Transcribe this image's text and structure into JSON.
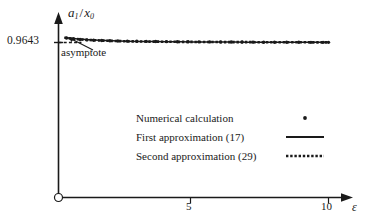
{
  "chart_data": {
    "type": "line",
    "title": "",
    "xlabel": "ε",
    "ylabel": "a_1/x_0",
    "xlim": [
      0,
      11.8
    ],
    "ylim": [
      0.9632,
      0.966
    ],
    "grid": false,
    "legend_position": "center-right",
    "xticks": [
      5,
      10
    ],
    "xtick_labels": [
      "5",
      "10"
    ],
    "yticks": [
      0.9643
    ],
    "ytick_labels": [
      "0.9643"
    ],
    "annotations": [
      {
        "text": "asymptote",
        "x": 0.35,
        "y": 0.96425,
        "points_to_x": 0.75,
        "points_to_y": 0.96448
      }
    ],
    "series": [
      {
        "name": "Numerical calculation",
        "style": "dot-marker",
        "x": [
          0.3,
          0.55,
          0.8,
          1.05,
          1.3,
          1.6,
          1.9,
          2.2,
          2.55,
          2.9,
          3.25,
          3.6,
          4.0,
          4.4,
          4.8,
          5.2,
          5.6,
          6.0,
          6.4,
          6.8,
          7.2,
          7.6,
          8.0,
          8.45,
          8.9,
          9.35,
          9.8,
          10.0
        ],
        "y": [
          0.96492,
          0.9648,
          0.96472,
          0.96466,
          0.96461,
          0.96457,
          0.96454,
          0.96451,
          0.96449,
          0.96447,
          0.96445,
          0.96444,
          0.96442,
          0.96441,
          0.9644,
          0.96439,
          0.96438,
          0.96437,
          0.96436,
          0.96436,
          0.96435,
          0.96434,
          0.96434,
          0.96433,
          0.96433,
          0.96432,
          0.96432,
          0.96432
        ]
      },
      {
        "name": "First approximation (17)",
        "style": "solid-line",
        "x": [
          0.22,
          0.5,
          1.0,
          1.5,
          2.0,
          2.5,
          3.0,
          3.5,
          4.0,
          4.5,
          5.0,
          5.5,
          6.0,
          6.5,
          7.0,
          7.5,
          8.0,
          8.5,
          9.0,
          9.5,
          10.0
        ],
        "y": [
          0.965,
          0.96485,
          0.9647,
          0.9646,
          0.96453,
          0.96448,
          0.96445,
          0.96443,
          0.96441,
          0.9644,
          0.96438,
          0.96437,
          0.96436,
          0.96436,
          0.96435,
          0.96434,
          0.96434,
          0.96433,
          0.96433,
          0.96432,
          0.96432
        ]
      },
      {
        "name": "Second approximation (29)",
        "style": "dotted-line",
        "x": [
          0.22,
          0.5,
          1.0,
          1.5,
          2.0,
          2.5,
          3.0,
          3.5,
          4.0,
          4.5,
          5.0,
          5.5,
          6.0,
          6.5,
          7.0,
          7.5,
          8.0,
          8.5,
          9.0,
          9.5,
          10.0
        ],
        "y": [
          0.96496,
          0.96482,
          0.96468,
          0.96458,
          0.96452,
          0.96447,
          0.96444,
          0.96442,
          0.96441,
          0.96439,
          0.96438,
          0.96437,
          0.96436,
          0.96435,
          0.96435,
          0.96434,
          0.96434,
          0.96433,
          0.96433,
          0.96432,
          0.96432
        ]
      },
      {
        "name": "Asymptote",
        "style": "dashed-short",
        "x": [
          0.0,
          0.85
        ],
        "y": [
          0.9643,
          0.9643
        ]
      }
    ]
  },
  "axes": {
    "y_tick_label": "0.9643",
    "y_title_numerator": "a",
    "y_title_num_sub": "1",
    "y_title_slash": "/",
    "y_title_denominator": "x",
    "y_title_den_sub": "0",
    "x_tick_labels": [
      "5",
      "10"
    ],
    "x_title": "ε",
    "origin_marker": "open-circle"
  },
  "annotation": {
    "asymptote_label": "asymptote"
  },
  "legend": {
    "entries": [
      {
        "label": "Numerical calculation",
        "marker": "dot-marker"
      },
      {
        "label": "First approximation (17)",
        "marker": "solid-line"
      },
      {
        "label": "Second approximation (29)",
        "marker": "dotted-line"
      }
    ]
  },
  "colors": {
    "ink": "#1a1a1a",
    "background": "#ffffff"
  }
}
